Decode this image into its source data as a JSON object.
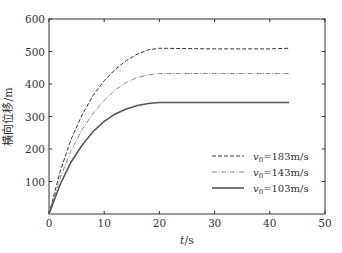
{
  "chart_data": {
    "type": "line",
    "title": "",
    "xlabel": "t/s",
    "ylabel": "横向位移/m",
    "xlim": [
      0,
      50
    ],
    "ylim": [
      0,
      600
    ],
    "xticks": [
      0,
      10,
      20,
      30,
      40,
      50
    ],
    "yticks": [
      100,
      200,
      300,
      400,
      500,
      600
    ],
    "yticks_shown_zero": false,
    "grid": false,
    "legend_position": "lower right",
    "x": [
      0,
      2,
      4,
      6,
      8,
      10,
      12,
      14,
      16,
      18,
      20,
      25,
      30,
      35,
      40,
      43.5
    ],
    "series": [
      {
        "name": "v0=183m/s",
        "style": "dashed",
        "values": [
          0,
          130,
          230,
          305,
          365,
          410,
          445,
          472,
          492,
          505,
          510,
          509,
          508,
          508,
          508,
          510
        ]
      },
      {
        "name": "v0=143m/s",
        "style": "dashdot",
        "values": [
          0,
          110,
          195,
          260,
          310,
          350,
          382,
          405,
          420,
          428,
          432,
          432,
          432,
          432,
          432,
          432
        ]
      },
      {
        "name": "v0=103m/s",
        "style": "solid",
        "values": [
          0,
          90,
          160,
          212,
          254,
          285,
          308,
          323,
          334,
          340,
          343,
          343,
          343,
          343,
          343,
          343
        ]
      }
    ]
  },
  "legend": {
    "items": [
      {
        "sub": "0",
        "base": "v",
        "value": "=183m/s"
      },
      {
        "sub": "0",
        "base": "v",
        "value": "=143m/s"
      },
      {
        "sub": "0",
        "base": "v",
        "value": "=103m/s"
      }
    ]
  },
  "axes": {
    "xlabel_t": "t",
    "xlabel_unit": "/s",
    "ylabel": "横向位移/m"
  }
}
